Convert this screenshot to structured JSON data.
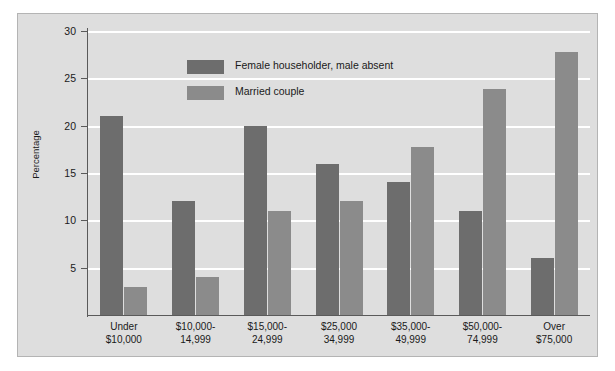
{
  "chart_data": {
    "type": "bar",
    "title": "",
    "subtitle": "",
    "xlabel": "",
    "ylabel": "Percentage",
    "ylim": [
      0,
      30
    ],
    "yticks": [
      5,
      10,
      15,
      20,
      25,
      30
    ],
    "ytick_labels": [
      "5",
      "10",
      "15",
      "20",
      "25",
      "30"
    ],
    "grid": "horizontal",
    "legend_position": "inside-top-center",
    "categories": [
      "Under\n$10,000",
      "$10,000-\n14,999",
      "$15,000-\n24,999",
      "$25,000\n34,999",
      "$35,000-\n49,999",
      "$50,000-\n74,999",
      "Over\n$75,000"
    ],
    "category_lines": [
      [
        "Under",
        "$10,000"
      ],
      [
        "$10,000-",
        "14,999"
      ],
      [
        "$15,000-",
        "24,999"
      ],
      [
        "$25,000",
        "34,999"
      ],
      [
        "$35,000-",
        "49,999"
      ],
      [
        "$50,000-",
        "74,999"
      ],
      [
        "Over",
        "$75,000"
      ]
    ],
    "series": [
      {
        "name": "Female householder, male absent",
        "color": "#6d6d6d",
        "values": [
          21,
          12,
          20,
          16,
          14,
          11,
          6
        ]
      },
      {
        "name": "Married couple",
        "color": "#8b8b8b",
        "values": [
          3,
          4,
          11,
          12,
          17.8,
          23.9,
          27.8
        ]
      }
    ]
  },
  "legend": {
    "items": [
      {
        "label": "Female householder, male absent",
        "color": "#6d6d6d"
      },
      {
        "label": "Married couple",
        "color": "#8b8b8b"
      }
    ]
  },
  "colors": {
    "panel_background": "#dedede",
    "figure_background": "#ffffff",
    "panel_border": "#b4b4b4",
    "gridline": "#ffffff",
    "axis": "#5a5a5a",
    "text": "#1a1a1a",
    "series_0": "#6d6d6d",
    "series_1": "#8b8b8b"
  }
}
